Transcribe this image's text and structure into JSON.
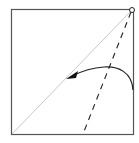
{
  "diagram": {
    "type": "origami-fold-step",
    "elements": {
      "paper": {
        "shape": "square",
        "color": "#ffffff",
        "stroke": "#555555"
      },
      "diagonal_crease": {
        "style": "thin solid",
        "color": "#c8c8c8"
      },
      "valley_fold_line": {
        "style": "dashed",
        "color": "#222222"
      },
      "fold_arrow": {
        "style": "curved arrow with filled head",
        "color": "#222222"
      },
      "pivot_point": {
        "symbol": "small circle",
        "location": "top-right corner"
      }
    }
  }
}
